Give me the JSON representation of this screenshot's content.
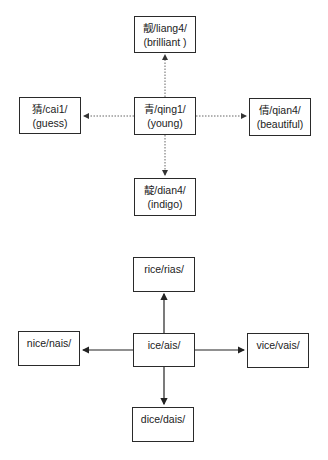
{
  "diagrams": [
    {
      "name": "chinese-character-family",
      "line_style": "dotted",
      "center": {
        "char": "青",
        "pinyin": "/qing1/",
        "line1": "青/qing1/",
        "line2": "(young)"
      },
      "nodes": {
        "top": {
          "line1": "靓/liang4/",
          "line2": "(brilliant )"
        },
        "left": {
          "line1": "猜/cai1/",
          "line2": "(guess)"
        },
        "right": {
          "line1": "倩/qian4/",
          "line2": "(beautiful)"
        },
        "bottom": {
          "line1": "靛/dian4/",
          "line2": "(indigo)"
        }
      }
    },
    {
      "name": "english-rhyme-family",
      "line_style": "solid",
      "center": {
        "line1": "ice/ais/"
      },
      "nodes": {
        "top": {
          "line1": "rice/rias/"
        },
        "left": {
          "line1": "nice/nais/"
        },
        "right": {
          "line1": "vice/vais/"
        },
        "bottom": {
          "line1": "dice/dais/"
        }
      }
    }
  ],
  "colors": {
    "border": "#2a2a2a",
    "dotted_line": "#555555",
    "solid_line": "#222222",
    "background": "#ffffff"
  }
}
